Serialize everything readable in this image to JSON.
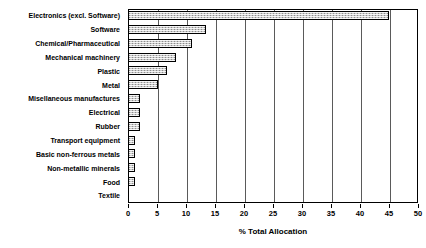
{
  "chart_data": {
    "type": "bar",
    "orientation": "horizontal",
    "title": "",
    "xlabel": "% Total Allocation",
    "ylabel": "",
    "xlim": [
      0,
      50
    ],
    "xticks": [
      0,
      5,
      10,
      15,
      20,
      25,
      30,
      35,
      40,
      45,
      50
    ],
    "xtick_labels": [
      "0",
      "5",
      "10",
      "15",
      "20",
      "25",
      "30",
      "35",
      "40",
      "45",
      "50"
    ],
    "grid": "vertical",
    "legend": "none",
    "bar_fill_color": "#c9c9c9",
    "bar_edge_color": "#000000",
    "categories": [
      "Electronics (excl. Software)",
      "Software",
      "Chemical/Pharmaceutical",
      "Mechanical machinery",
      "Plastic",
      "Metal",
      "Misellaneous manufactures",
      "Electrical",
      "Rubber",
      "Transport equipment",
      "Basic non-ferrous metals",
      "Non-metallic minerals",
      "Food",
      "Textile"
    ],
    "values": [
      45.0,
      13.5,
      11.0,
      8.3,
      6.7,
      5.2,
      2.0,
      2.0,
      2.0,
      1.2,
      1.2,
      1.2,
      1.2,
      0.0
    ]
  }
}
